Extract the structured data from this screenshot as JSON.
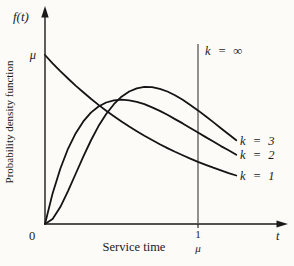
{
  "figure": {
    "y_axis_symbol": "f(t)",
    "ylabel": "Probability density function",
    "xlabel": "Service time",
    "y_intercept_label": "μ",
    "origin_label": "0",
    "x_axis_symbol": "t",
    "x_tick_numerator": "1",
    "x_tick_denominator": "μ",
    "vline_label": "k = ∞",
    "curve_labels": [
      "k = 3",
      "k = 2",
      "k = 1"
    ]
  },
  "chart_data": {
    "type": "line",
    "title": "",
    "xlabel": "Service time",
    "ylabel": "Probability density function",
    "x_axis_symbol": "t",
    "y_axis_symbol": "f(t)",
    "xlim": [
      0,
      1.55
    ],
    "ylim": [
      0,
      1.25
    ],
    "grid": false,
    "legend_position": "inline-right-of-curves",
    "x_tick_labels": [
      {
        "x": 1,
        "label": "1/μ"
      }
    ],
    "y_marks": [
      {
        "y": 1,
        "label": "μ"
      }
    ],
    "vertical_line": {
      "x": 1,
      "label": "k = ∞"
    },
    "x": [
      0,
      0.05,
      0.1,
      0.15,
      0.2,
      0.25,
      0.3,
      0.35,
      0.4,
      0.45,
      0.5,
      0.55,
      0.6,
      0.65,
      0.7,
      0.75,
      0.8,
      0.85,
      0.9,
      0.95,
      1,
      1.05,
      1.1,
      1.15,
      1.2,
      1.25
    ],
    "series": [
      {
        "id": "k1",
        "name": "k = 1",
        "values": [
          1,
          0.951,
          0.905,
          0.861,
          0.819,
          0.779,
          0.741,
          0.705,
          0.67,
          0.638,
          0.607,
          0.577,
          0.549,
          0.522,
          0.497,
          0.472,
          0.449,
          0.427,
          0.407,
          0.387,
          0.368,
          0.35,
          0.333,
          0.317,
          0.301,
          0.287
        ]
      },
      {
        "id": "k2",
        "name": "k = 2",
        "values": [
          0,
          0.181,
          0.327,
          0.445,
          0.536,
          0.607,
          0.659,
          0.695,
          0.719,
          0.732,
          0.736,
          0.732,
          0.723,
          0.709,
          0.69,
          0.669,
          0.646,
          0.621,
          0.595,
          0.568,
          0.541,
          0.514,
          0.488,
          0.461,
          0.436,
          0.41
        ]
      },
      {
        "id": "k3",
        "name": "k = 3",
        "values": [
          0,
          0.029,
          0.1,
          0.194,
          0.296,
          0.399,
          0.494,
          0.579,
          0.651,
          0.709,
          0.753,
          0.784,
          0.803,
          0.811,
          0.81,
          0.8,
          0.784,
          0.762,
          0.735,
          0.705,
          0.672,
          0.638,
          0.603,
          0.567,
          0.531,
          0.496
        ]
      }
    ]
  }
}
